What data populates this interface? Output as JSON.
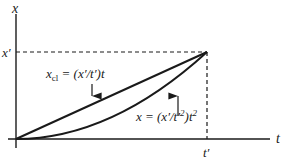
{
  "diagram": {
    "axes": {
      "y_label": "x",
      "x_label": "t",
      "y_tick": "x′",
      "x_tick": "t′"
    },
    "curves": [
      {
        "name": "classical-line",
        "label_main": "x",
        "label_sub": "cl",
        "label_rest": " = (x′/t′)t",
        "shape": "linear"
      },
      {
        "name": "quadratic-path",
        "label": "x = (x′/t′²)t²",
        "label_main": "x = (x′/t′",
        "label_sup1": "2",
        "label_rest": ")t",
        "label_sup2": "2",
        "shape": "parabola"
      }
    ],
    "colors": {
      "line": "#1a1a1a",
      "background": "#ffffff"
    }
  }
}
